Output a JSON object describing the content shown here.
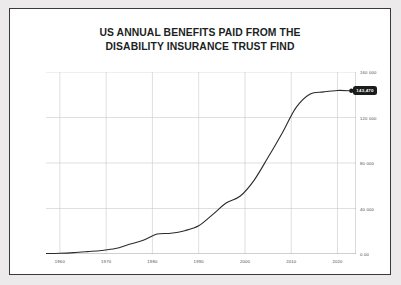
{
  "chart_data": {
    "type": "line",
    "title": "US ANNUAL BENEFITS PAID FROM THE\nDISABILITY INSURANCE TRUST FIND",
    "title_line1": "US ANNUAL BENEFITS PAID FROM THE",
    "title_line2": "DISABILITY INSURANCE TRUST FIND",
    "xlabel": "",
    "ylabel": "",
    "grid": true,
    "legend": "none",
    "xlim": [
      1957,
      2024
    ],
    "ylim": [
      0,
      160000
    ],
    "xticks": [
      "1960",
      "1970",
      "1980",
      "1990",
      "2000",
      "2010",
      "2020"
    ],
    "xtick_values": [
      1960,
      1970,
      1980,
      1990,
      2000,
      2010,
      2020
    ],
    "yticks": [
      "0.00",
      "40 000",
      "80 000",
      "120 000",
      "160 000"
    ],
    "ytick_values": [
      0,
      40000,
      80000,
      120000,
      160000
    ],
    "endpoint_label": "143,470",
    "line_color": "#2b2b2b",
    "grid_color": "#c9c9c9",
    "axis_color": "#9a9a9a",
    "background_color": "#ffffff",
    "page_background_color": "#eceaea",
    "border_color": "#3a3a3a",
    "x": [
      1957,
      1960,
      1963,
      1966,
      1969,
      1972,
      1975,
      1978,
      1981,
      1984,
      1987,
      1990,
      1993,
      1996,
      1999,
      2002,
      2005,
      2008,
      2011,
      2014,
      2017,
      2020,
      2023
    ],
    "values": [
      300,
      600,
      1200,
      2100,
      3100,
      4800,
      8500,
      12000,
      17500,
      18200,
      20500,
      24800,
      34600,
      45000,
      51000,
      65000,
      85000,
      106000,
      128500,
      140500,
      142500,
      143800,
      143470
    ]
  }
}
